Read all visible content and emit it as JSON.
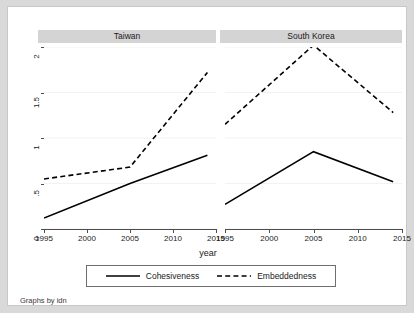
{
  "figure": {
    "axis_label_x": "year",
    "caption": "Graphs by idn",
    "background": "#d9d9d9",
    "plot_background": "#ffffff",
    "panel_title_background": "#d4d4d4",
    "line_color": "#000000"
  },
  "legend": {
    "entries": [
      {
        "label": "Cohesiveness",
        "style": "solid"
      },
      {
        "label": "Embeddedness",
        "style": "dashed"
      }
    ]
  },
  "panels": [
    {
      "title": "Taiwan"
    },
    {
      "title": "South Korea"
    }
  ],
  "axes": {
    "y_ticks": [
      "0",
      ".5",
      "1",
      "1.5",
      "2"
    ],
    "x_ticks": [
      "1995",
      "2000",
      "2005",
      "2010",
      "2015"
    ]
  },
  "chart_data": {
    "type": "line",
    "title": "",
    "xlabel": "year",
    "ylabel": "",
    "xlim": [
      1995,
      2015
    ],
    "ylim": [
      0,
      2
    ],
    "x_ticks": [
      1995,
      2000,
      2005,
      2010,
      2015
    ],
    "y_ticks": [
      0,
      0.5,
      1,
      1.5,
      2
    ],
    "y_tick_labels": [
      "0",
      ".5",
      "1",
      "1.5",
      "2"
    ],
    "grid": true,
    "legend_position": "bottom",
    "panels": [
      {
        "name": "Taiwan",
        "x": [
          1995,
          2005,
          2014
        ],
        "series": [
          {
            "name": "Cohesiveness",
            "style": "solid",
            "values": [
              0.12,
              0.5,
              0.81
            ]
          },
          {
            "name": "Embeddedness",
            "style": "dashed",
            "values": [
              0.55,
              0.68,
              1.72
            ]
          }
        ]
      },
      {
        "name": "South Korea",
        "x": [
          1995,
          2005,
          2014
        ],
        "series": [
          {
            "name": "Cohesiveness",
            "style": "solid",
            "values": [
              0.27,
              0.85,
              0.52
            ]
          },
          {
            "name": "Embeddedness",
            "style": "dashed",
            "values": [
              1.15,
              2.02,
              1.28
            ]
          }
        ]
      }
    ]
  }
}
